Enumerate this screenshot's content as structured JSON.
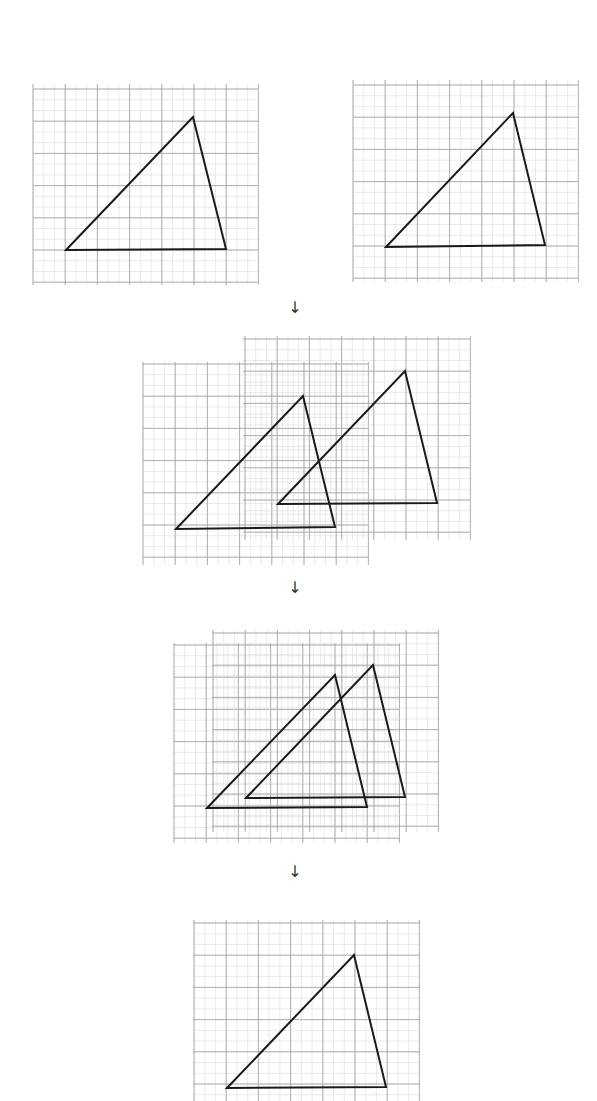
{
  "diagram": {
    "colors": {
      "grid_major": "#9a9a9a",
      "grid_minor": "#d6d6d6",
      "triangle": "#1a1a1a",
      "arrow": "#333333"
    },
    "grid": {
      "major_spacing": 32.2,
      "minor_per_major": 3
    },
    "arrows": [
      {
        "label": "↓",
        "x": 295,
        "y": 302
      },
      {
        "label": "↓",
        "x": 295,
        "y": 582
      },
      {
        "label": "↓",
        "x": 295,
        "y": 866
      }
    ],
    "panels": [
      {
        "name": "step-1-left",
        "grids": [
          {
            "x0": 33,
            "y0": 84,
            "x1": 258,
            "y1": 285,
            "origin_x": 33,
            "origin_y": 89
          }
        ],
        "triangles": [
          {
            "points": [
              [
                66,
                250
              ],
              [
                193,
                117
              ],
              [
                226,
                249
              ]
            ]
          }
        ]
      },
      {
        "name": "step-1-right",
        "grids": [
          {
            "x0": 353,
            "y0": 80,
            "x1": 578,
            "y1": 282,
            "origin_x": 353,
            "origin_y": 85
          }
        ],
        "triangles": [
          {
            "points": [
              [
                386,
                247
              ],
              [
                513,
                113
              ],
              [
                545,
                245
              ]
            ]
          }
        ]
      },
      {
        "name": "step-2-overlay",
        "grids": [
          {
            "x0": 143,
            "y0": 362,
            "x1": 368,
            "y1": 565,
            "origin_x": 143,
            "origin_y": 364
          },
          {
            "x0": 243,
            "y0": 336,
            "x1": 470,
            "y1": 540,
            "origin_x": 245,
            "origin_y": 339
          }
        ],
        "triangles": [
          {
            "points": [
              [
                176,
                529
              ],
              [
                303,
                396
              ],
              [
                335,
                527
              ]
            ]
          },
          {
            "points": [
              [
                278,
                504
              ],
              [
                405,
                371
              ],
              [
                437,
                503
              ]
            ]
          }
        ]
      },
      {
        "name": "step-3-overlay",
        "grids": [
          {
            "x0": 174,
            "y0": 643,
            "x1": 400,
            "y1": 843,
            "origin_x": 174,
            "origin_y": 645
          },
          {
            "x0": 212,
            "y0": 630,
            "x1": 439,
            "y1": 832,
            "origin_x": 213,
            "origin_y": 633
          }
        ],
        "triangles": [
          {
            "points": [
              [
                207,
                808
              ],
              [
                335,
                675
              ],
              [
                367,
                807
              ]
            ]
          },
          {
            "points": [
              [
                246,
                798
              ],
              [
                373,
                665
              ],
              [
                405,
                797
              ]
            ]
          }
        ]
      },
      {
        "name": "step-4-result",
        "grids": [
          {
            "x0": 193,
            "y0": 920,
            "x1": 420,
            "y1": 1101,
            "origin_x": 194,
            "origin_y": 923
          }
        ],
        "triangles": [
          {
            "points": [
              [
                227,
                1088
              ],
              [
                354,
                955
              ],
              [
                386,
                1087
              ]
            ]
          }
        ]
      }
    ]
  }
}
